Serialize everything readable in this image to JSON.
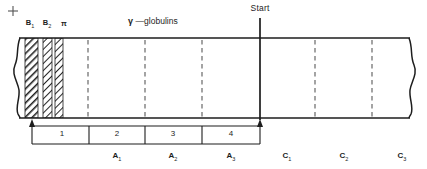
{
  "figure": {
    "title_polarity": "+",
    "start_label": "Start",
    "gamma_label_symbol": "γ",
    "gamma_label_text": "—globulins",
    "band_labels": [
      {
        "name": "B",
        "sub": "1",
        "x": 30
      },
      {
        "name": "B",
        "sub": "2",
        "x": 47
      },
      {
        "name": "π",
        "sub": "",
        "x": 64
      }
    ],
    "segments": [
      {
        "label": "1",
        "x": 62
      },
      {
        "label": "2",
        "x": 117
      },
      {
        "label": "3",
        "x": 172
      },
      {
        "label": "4",
        "x": 227
      }
    ],
    "fractions_a": [
      {
        "name": "A",
        "sub": "1",
        "x": 117
      },
      {
        "name": "A",
        "sub": "2",
        "x": 172
      },
      {
        "name": "A",
        "sub": "3",
        "x": 227
      }
    ],
    "fractions_c": [
      {
        "name": "C",
        "sub": "1",
        "x": 287
      },
      {
        "name": "C",
        "sub": "2",
        "x": 342
      },
      {
        "name": "C",
        "sub": "3",
        "x": 401
      }
    ],
    "colors": {
      "ink": "#1d1d1d",
      "strip_fill": "#ffffff",
      "hatch": "#222222",
      "dashed": "#5a5a5a",
      "paper": "#ffffff"
    },
    "strip": {
      "top_y": 38,
      "bottom_y": 118,
      "left_x": 14,
      "right_x": 415
    },
    "bands": [
      {
        "id": "B1",
        "x": 25,
        "width": 13,
        "density": "heavy"
      },
      {
        "id": "B2",
        "x": 43,
        "width": 9,
        "density": "medium"
      },
      {
        "id": "pi",
        "x": 55,
        "width": 8,
        "density": "medium"
      }
    ],
    "dashed_dividers": [
      88,
      145,
      202,
      315,
      372
    ],
    "start_line_x": 260,
    "bracket": {
      "left_x": 32,
      "right_x": 260,
      "top_y": 122,
      "bottom_y": 144
    }
  }
}
